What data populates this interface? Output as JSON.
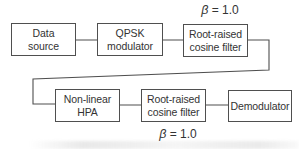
{
  "diagram": {
    "blocks": [
      {
        "lines": [
          "Data",
          "source"
        ]
      },
      {
        "lines": [
          "QPSK",
          "modulator"
        ]
      },
      {
        "lines": [
          "Root-raised",
          "cosine filter"
        ]
      },
      {
        "lines": [
          "Non-linear",
          "HPA"
        ]
      },
      {
        "lines": [
          "Root-raised",
          "cosine filter"
        ]
      },
      {
        "lines": [
          "Demodulator"
        ]
      }
    ],
    "annotations": {
      "beta_top": {
        "symbol": "β",
        "value": "= 1.0"
      },
      "beta_bottom": {
        "symbol": "β",
        "value": "= 1.0"
      }
    },
    "colors": {
      "line": "#4f4f4f",
      "text": "#333333",
      "background": "#ffffff"
    }
  }
}
